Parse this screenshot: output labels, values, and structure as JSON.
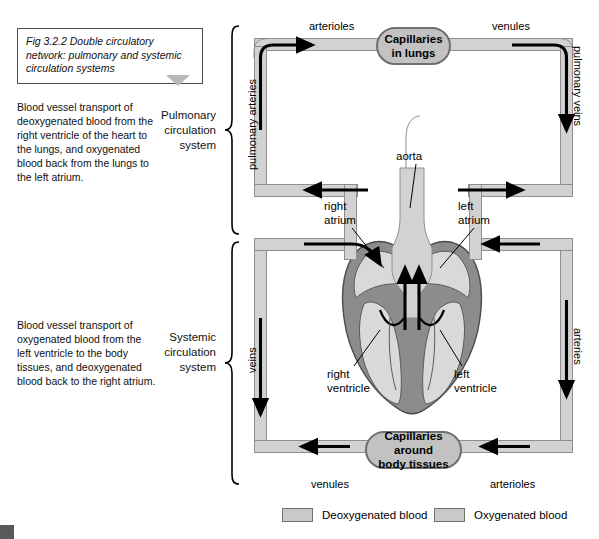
{
  "figure": {
    "caption": "Fig 3.2.2 Double circulatory network: pulmonary and systemic circulation systems"
  },
  "descriptions": {
    "pulmonary": "Blood vessel transport of deoxygenated blood from the right ventricle of the heart to the lungs, and oxygenated blood back from the lungs to the left atrium.",
    "systemic": "Blood vessel transport of oxygenated blood from the left ventricle to the body tissues, and deoxygenated blood back to the right atrium."
  },
  "system_labels": {
    "pulmonary": "Pulmonary\ncirculation\nsystem",
    "pulmonary_line1": "Pulmonary",
    "pulmonary_line2": "circulation",
    "pulmonary_line3": "system",
    "systemic_line1": "Systemic",
    "systemic_line2": "circulation",
    "systemic_line3": "system"
  },
  "diagram": {
    "capillaries_lungs_line1": "Capillaries",
    "capillaries_lungs_line2": "in lungs",
    "capillaries_body_line1": "Capillaries around",
    "capillaries_body_line2": "body tissues",
    "top_arterioles": "arterioles",
    "top_venules": "venules",
    "bottom_venules": "venules",
    "bottom_arterioles": "arterioles",
    "pulmonary_arteries": "pulmonary arteries",
    "pulmonary_veins": "pulmonary veins",
    "veins": "veins",
    "arteries": "arteries",
    "aorta": "aorta",
    "right_atrium_line1": "right",
    "right_atrium_line2": "atrium",
    "left_atrium_line1": "left",
    "left_atrium_line2": "atrium",
    "right_ventricle_line1": "right",
    "right_ventricle_line2": "ventricle",
    "left_ventricle_line1": "left",
    "left_ventricle_line2": "ventricle"
  },
  "legend": {
    "deoxygenated": "Deoxygenated blood",
    "oxygenated": "Oxygenated blood",
    "deoxygenated_color": "#c9c9c9",
    "oxygenated_color": "#c9c9c9"
  },
  "colors": {
    "vessel_fill": "#d2d2d2",
    "vessel_stroke": "#8e8e8e",
    "capillary_fill": "#c2c2c2",
    "capillary_stroke": "#6f6f6f",
    "heart_muscle": "#8c8c8c",
    "heart_chamber": "#d9d9d9",
    "arrow": "#000000",
    "caption_border": "#4a4a4a",
    "triangle": "#b8b8b8"
  }
}
